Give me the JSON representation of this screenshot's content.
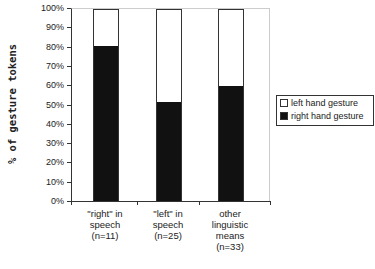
{
  "chart_data": {
    "type": "bar",
    "stacked": true,
    "title": "",
    "xlabel": "",
    "ylabel": "% of gesture tokens",
    "ylim": [
      0,
      100
    ],
    "yticks": [
      "0%",
      "10%",
      "20%",
      "30%",
      "40%",
      "50%",
      "60%",
      "70%",
      "80%",
      "90%",
      "100%"
    ],
    "categories": [
      "\"right\" in speech (n=11)",
      "\"left\" in speech (n=25)",
      "other linguistic means (n=33)"
    ],
    "category_lines": [
      [
        "\"right\" in",
        "speech",
        "(n=11)"
      ],
      [
        "\"left\" in",
        "speech",
        "(n=25)"
      ],
      [
        "other",
        "linguistic",
        "means",
        "(n=33)"
      ]
    ],
    "series": [
      {
        "name": "right hand gesture",
        "color": "#111111",
        "values": [
          81,
          52,
          60
        ]
      },
      {
        "name": "left hand gesture",
        "color": "#ffffff",
        "values": [
          19,
          48,
          40
        ]
      }
    ],
    "legend": {
      "position": "right",
      "entries": [
        "left hand gesture",
        "right hand gesture"
      ]
    },
    "grid": false
  }
}
